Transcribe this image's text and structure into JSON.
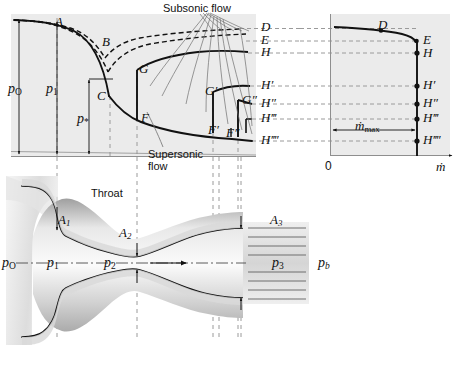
{
  "figure": {
    "title_annotations": {
      "subsonic": "Subsonic flow",
      "supersonic_line1": "Supersonic",
      "supersonic_line2": "flow",
      "throat": "Throat"
    },
    "upper_chart": {
      "type": "line",
      "description": "Pressure distribution along a converging-diverging nozzle for several back pressures",
      "ylabel_items": [
        {
          "text": "p",
          "sub": "O",
          "x": 14,
          "y": 88
        },
        {
          "text": "p",
          "sub": "1",
          "x": 47,
          "y": 88
        },
        {
          "text": "p",
          "sub": "*",
          "x": 84,
          "y": 118
        }
      ],
      "curve_labels": [
        {
          "label": "A",
          "x": 56,
          "y": 22
        },
        {
          "label": "B",
          "x": 104,
          "y": 42
        },
        {
          "label": "C",
          "x": 108,
          "y": 96
        },
        {
          "label": "G",
          "x": 140,
          "y": 70
        },
        {
          "label": "F",
          "x": 141,
          "y": 118
        },
        {
          "label": "G′",
          "x": 207,
          "y": 92
        },
        {
          "label": "F′",
          "x": 210,
          "y": 130
        },
        {
          "label": "G″",
          "x": 246,
          "y": 101
        },
        {
          "label": "F″",
          "x": 231,
          "y": 133
        }
      ],
      "right_axis_labels": [
        {
          "label": "D",
          "y": 26
        },
        {
          "label": "E",
          "y": 39
        },
        {
          "label": "H",
          "y": 51
        },
        {
          "label": "H′",
          "y": 84
        },
        {
          "label": "H″",
          "y": 102
        },
        {
          "label": "H‴",
          "y": 117
        },
        {
          "label": "H‴′",
          "y": 139
        }
      ]
    },
    "right_chart": {
      "type": "line",
      "description": "Mass flow rate versus back pressure; flow chokes at m-dot max",
      "xlabel": "ṁ",
      "origin_label": "0",
      "mmax_label": "ṁ",
      "mmax_sub": "max",
      "point_labels": [
        {
          "label": "D",
          "x": 381,
          "y": 27
        },
        {
          "label": "E",
          "x": 424,
          "y": 41
        },
        {
          "label": "H",
          "x": 424,
          "y": 53
        },
        {
          "label": "H′",
          "x": 424,
          "y": 85
        },
        {
          "label": "H″",
          "x": 424,
          "y": 103
        },
        {
          "label": "H‴",
          "x": 424,
          "y": 118
        },
        {
          "label": "H‴′",
          "x": 424,
          "y": 140
        }
      ]
    },
    "nozzle": {
      "area_labels": [
        {
          "text": "A",
          "sub": "1",
          "x": 56,
          "y": 219
        },
        {
          "text": "A",
          "sub": "2",
          "x": 121,
          "y": 232
        },
        {
          "text": "A",
          "sub": "3",
          "x": 272,
          "y": 219
        }
      ],
      "pressure_labels": [
        {
          "text": "p",
          "sub": "O",
          "x": 4,
          "y": 262
        },
        {
          "text": "p",
          "sub": "1",
          "x": 48,
          "y": 262
        },
        {
          "text": "p",
          "sub": "2",
          "x": 105,
          "y": 262
        },
        {
          "text": "p",
          "sub": "3",
          "x": 273,
          "y": 262
        },
        {
          "text": "p",
          "sub": "b",
          "x": 320,
          "y": 262
        }
      ]
    },
    "colors": {
      "ink": "#111111",
      "plot_fill": "#ebebeb",
      "dashed_guide": "#9a9a9a",
      "wall_shadow": "#cfcfcf",
      "thin_rule": "#8e8e8e"
    }
  }
}
